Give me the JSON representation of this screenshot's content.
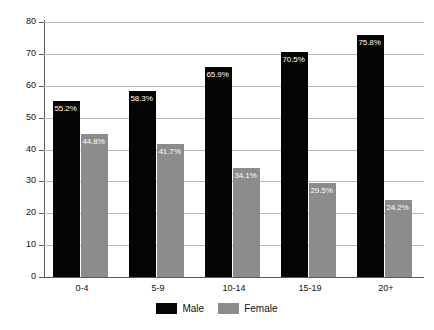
{
  "chart_data": {
    "type": "bar",
    "title": "",
    "subtitle": "",
    "xlabel": "",
    "ylabel": "",
    "ylim": [
      0,
      80
    ],
    "y_ticks": [
      0,
      10,
      20,
      30,
      40,
      50,
      60,
      70,
      80
    ],
    "grid": "horizontal",
    "legend_position": "bottom-center",
    "categories": [
      "0-4",
      "5-9",
      "10-14",
      "15-19",
      "20+"
    ],
    "series": [
      {
        "name": "Male",
        "color": "#050505",
        "values": [
          55.2,
          58.3,
          65.9,
          70.5,
          75.8
        ],
        "labels": [
          "55.2%",
          "58.3%",
          "65.9%",
          "70.5%",
          "75.8%"
        ]
      },
      {
        "name": "Female",
        "color": "#8c8c8c",
        "values": [
          44.8,
          41.7,
          34.1,
          29.5,
          24.2
        ],
        "labels": [
          "44.8%",
          "41.7%",
          "34.1%",
          "29.5%",
          "24.2%"
        ]
      }
    ]
  },
  "axes": {
    "y_tick_labels": [
      "0",
      "10",
      "20",
      "30",
      "40",
      "50",
      "60",
      "70",
      "80"
    ],
    "x_tick_labels": [
      "0-4",
      "5-9",
      "10-14",
      "15-19",
      "20+"
    ]
  },
  "legend": {
    "items": [
      {
        "label": "Male",
        "color": "#050505"
      },
      {
        "label": "Female",
        "color": "#8c8c8c"
      }
    ]
  }
}
